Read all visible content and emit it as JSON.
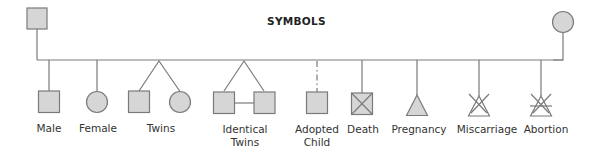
{
  "title": "SYMBOLS",
  "colors": {
    "stroke": "#7a7a7a",
    "fill": "#d6d6d6",
    "text": "#333333"
  },
  "parents": [
    {
      "shape": "square",
      "meaning": "father"
    },
    {
      "shape": "circle",
      "meaning": "mother"
    }
  ],
  "symbols": [
    {
      "id": "male",
      "label": "Male",
      "shape": "square"
    },
    {
      "id": "female",
      "label": "Female",
      "shape": "circle"
    },
    {
      "id": "twins",
      "label": "Twins",
      "shape": "square+circle forked"
    },
    {
      "id": "identical-twins",
      "label": "Identical Twins",
      "label_lines": [
        "Identical",
        "Twins"
      ],
      "shape": "two squares forked with bar"
    },
    {
      "id": "adopted-child",
      "label": "Adopted Child",
      "label_lines": [
        "Adopted",
        "Child"
      ],
      "shape": "square with dashed line"
    },
    {
      "id": "death",
      "label": "Death",
      "shape": "square with X"
    },
    {
      "id": "pregnancy",
      "label": "Pregnancy",
      "shape": "filled triangle"
    },
    {
      "id": "miscarriage",
      "label": "Miscarriage",
      "shape": "open triangle with X"
    },
    {
      "id": "abortion",
      "label": "Abortion",
      "shape": "open triangle with X and bar"
    }
  ]
}
